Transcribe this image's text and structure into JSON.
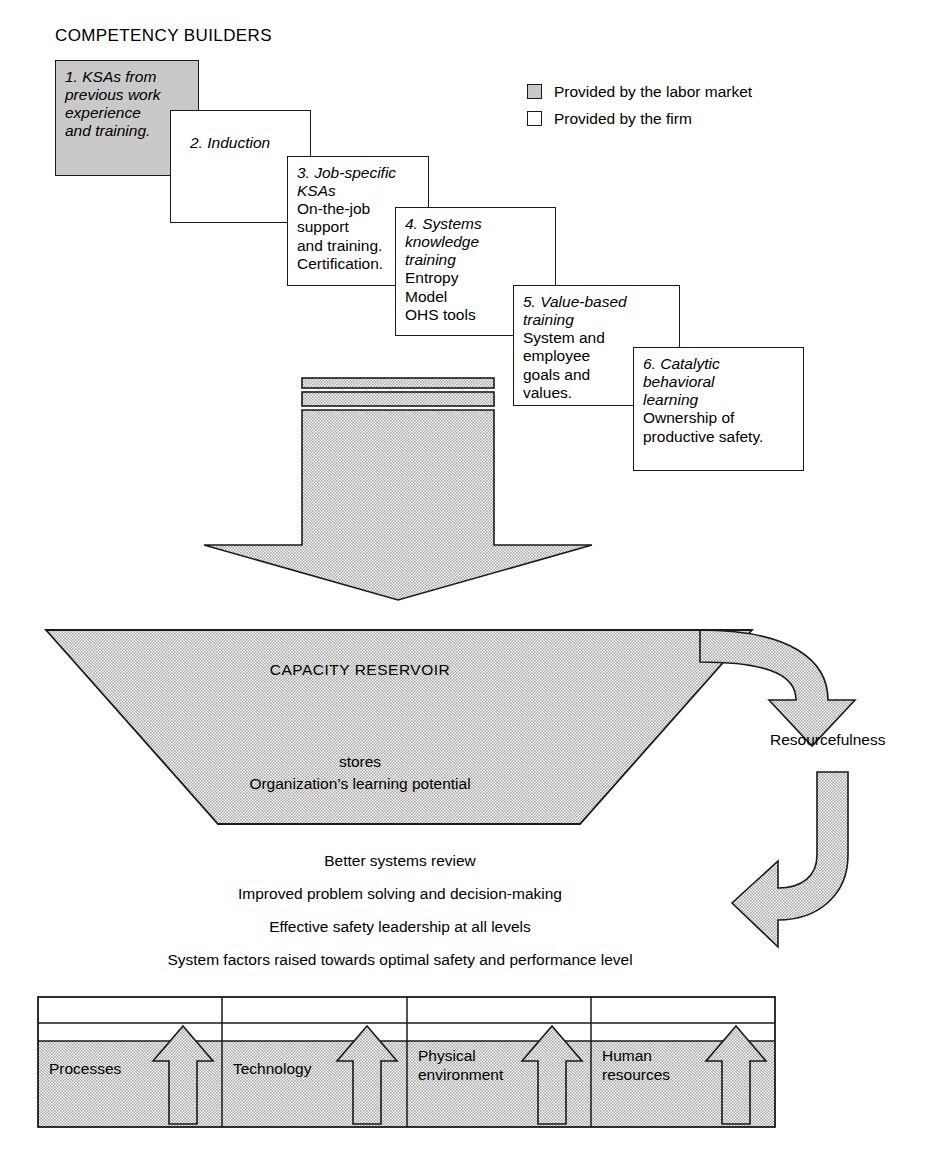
{
  "heading": "COMPETENCY BUILDERS",
  "legend": {
    "items": [
      {
        "swatch": "shaded",
        "label": "Provided by the labor market"
      },
      {
        "swatch": "empty",
        "label": "Provided by the firm"
      }
    ]
  },
  "competency_boxes": [
    {
      "id": 1,
      "title": "1. KSAs from\nprevious work\nexperience\nand training.",
      "body": "",
      "shaded": true
    },
    {
      "id": 2,
      "title": "2. Induction",
      "body": "",
      "shaded": false
    },
    {
      "id": 3,
      "title": "3. Job-specific\nKSAs",
      "body": "On-the-job\nsupport\nand training.\nCertification.",
      "shaded": false
    },
    {
      "id": 4,
      "title": "4. Systems\nknowledge\ntraining",
      "body": "Entropy\nModel\nOHS tools",
      "shaded": false
    },
    {
      "id": 5,
      "title": "5. Value-based\ntraining",
      "body": "System and\nemployee\ngoals and\nvalues.",
      "shaded": false
    },
    {
      "id": 6,
      "title": "6. Catalytic\nbehavioral\nlearning",
      "body": "Ownership of\nproductive safety.",
      "shaded": false
    }
  ],
  "reservoir": {
    "title": "CAPACITY RESERVOIR",
    "subtitle": "stores\nOrganization’s learning potential"
  },
  "resourcefulness_label": "Resourcefulness",
  "outcomes": [
    "Better systems review",
    "Improved problem solving and decision-making",
    "Effective safety leadership at all levels",
    "System factors raised towards optimal safety and performance level"
  ],
  "system_factors": [
    {
      "label": "Processes"
    },
    {
      "label": "Technology"
    },
    {
      "label": "Physical\nenvironment"
    },
    {
      "label": "Human\nresources"
    }
  ],
  "colors": {
    "fill_gray": "#c9c9c9",
    "stroke": "#1a1a1a",
    "background": "#ffffff",
    "text": "#000000"
  }
}
